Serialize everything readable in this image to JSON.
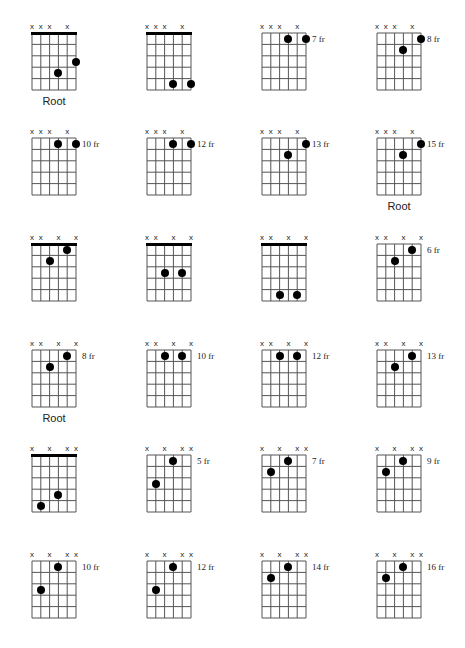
{
  "layout": {
    "columns_x": [
      32,
      147,
      262,
      377
    ],
    "rows_y": [
      33,
      138,
      244,
      350,
      455,
      561
    ],
    "grid_width": 44,
    "grid_height": 57,
    "strings": 6,
    "frets": 5
  },
  "colors": {
    "line": "#555555",
    "dot": "#000000",
    "text": "#222222",
    "background": "#ffffff"
  },
  "mute_symbol": "x",
  "diagrams": [
    {
      "muted": [
        0,
        1,
        2,
        4
      ],
      "nut": true,
      "fret_label": "",
      "root_label": "Root",
      "dots": [
        {
          "string": 3,
          "fret": 4
        },
        {
          "string": 5,
          "fret": 3
        }
      ]
    },
    {
      "muted": [
        0,
        1,
        2,
        4
      ],
      "nut": true,
      "fret_label": "",
      "root_label": "",
      "dots": [
        {
          "string": 3,
          "fret": 5
        },
        {
          "string": 5,
          "fret": 5
        }
      ]
    },
    {
      "muted": [
        0,
        1,
        2,
        4
      ],
      "nut": false,
      "fret_label": "7 fr",
      "root_label": "",
      "dots": [
        {
          "string": 3,
          "fret": 1
        },
        {
          "string": 5,
          "fret": 1
        }
      ]
    },
    {
      "muted": [
        0,
        1,
        2,
        4
      ],
      "nut": false,
      "fret_label": "8 fr",
      "root_label": "",
      "dots": [
        {
          "string": 5,
          "fret": 1
        },
        {
          "string": 3,
          "fret": 2
        }
      ]
    },
    {
      "muted": [
        0,
        1,
        2,
        4
      ],
      "nut": false,
      "fret_label": "10 fr",
      "root_label": "",
      "dots": [
        {
          "string": 3,
          "fret": 1
        },
        {
          "string": 5,
          "fret": 1
        }
      ]
    },
    {
      "muted": [
        0,
        1,
        2,
        4
      ],
      "nut": false,
      "fret_label": "12 fr",
      "root_label": "",
      "dots": [
        {
          "string": 3,
          "fret": 1
        },
        {
          "string": 5,
          "fret": 1
        }
      ]
    },
    {
      "muted": [
        0,
        1,
        2,
        4
      ],
      "nut": false,
      "fret_label": "13 fr",
      "root_label": "",
      "dots": [
        {
          "string": 5,
          "fret": 1
        },
        {
          "string": 3,
          "fret": 2
        }
      ]
    },
    {
      "muted": [
        0,
        1,
        2,
        4
      ],
      "nut": false,
      "fret_label": "15 fr",
      "root_label": "Root",
      "dots": [
        {
          "string": 5,
          "fret": 1
        },
        {
          "string": 3,
          "fret": 2
        }
      ]
    },
    {
      "muted": [
        0,
        1,
        3,
        5
      ],
      "nut": true,
      "fret_label": "",
      "root_label": "",
      "dots": [
        {
          "string": 4,
          "fret": 1
        },
        {
          "string": 2,
          "fret": 2
        }
      ]
    },
    {
      "muted": [
        0,
        1,
        3,
        5
      ],
      "nut": true,
      "fret_label": "",
      "root_label": "",
      "dots": [
        {
          "string": 2,
          "fret": 3
        },
        {
          "string": 4,
          "fret": 3
        }
      ]
    },
    {
      "muted": [
        0,
        1,
        3,
        5
      ],
      "nut": true,
      "fret_label": "",
      "root_label": "",
      "dots": [
        {
          "string": 2,
          "fret": 5
        },
        {
          "string": 4,
          "fret": 5
        }
      ]
    },
    {
      "muted": [
        0,
        1,
        3,
        5
      ],
      "nut": false,
      "fret_label": "6 fr",
      "root_label": "",
      "dots": [
        {
          "string": 4,
          "fret": 1
        },
        {
          "string": 2,
          "fret": 2
        }
      ]
    },
    {
      "muted": [
        0,
        1,
        3,
        5
      ],
      "nut": false,
      "fret_label": "8 fr",
      "root_label": "Root",
      "dots": [
        {
          "string": 4,
          "fret": 1
        },
        {
          "string": 2,
          "fret": 2
        }
      ]
    },
    {
      "muted": [
        0,
        1,
        3,
        5
      ],
      "nut": false,
      "fret_label": "10 fr",
      "root_label": "",
      "dots": [
        {
          "string": 2,
          "fret": 1
        },
        {
          "string": 4,
          "fret": 1
        }
      ]
    },
    {
      "muted": [
        0,
        1,
        3,
        5
      ],
      "nut": false,
      "fret_label": "12 fr",
      "root_label": "",
      "dots": [
        {
          "string": 2,
          "fret": 1
        },
        {
          "string": 4,
          "fret": 1
        }
      ]
    },
    {
      "muted": [
        0,
        1,
        3,
        5
      ],
      "nut": false,
      "fret_label": "13 fr",
      "root_label": "",
      "dots": [
        {
          "string": 4,
          "fret": 1
        },
        {
          "string": 2,
          "fret": 2
        }
      ]
    },
    {
      "muted": [
        0,
        2,
        4,
        5
      ],
      "nut": true,
      "fret_label": "",
      "root_label": "",
      "dots": [
        {
          "string": 3,
          "fret": 4
        },
        {
          "string": 1,
          "fret": 5
        }
      ]
    },
    {
      "muted": [
        0,
        2,
        4,
        5
      ],
      "nut": false,
      "fret_label": "5 fr",
      "root_label": "",
      "dots": [
        {
          "string": 3,
          "fret": 1
        },
        {
          "string": 1,
          "fret": 3
        }
      ]
    },
    {
      "muted": [
        0,
        2,
        4,
        5
      ],
      "nut": false,
      "fret_label": "7 fr",
      "root_label": "",
      "dots": [
        {
          "string": 3,
          "fret": 1
        },
        {
          "string": 1,
          "fret": 2
        }
      ]
    },
    {
      "muted": [
        0,
        2,
        4,
        5
      ],
      "nut": false,
      "fret_label": "9 fr",
      "root_label": "",
      "dots": [
        {
          "string": 3,
          "fret": 1
        },
        {
          "string": 1,
          "fret": 2
        }
      ]
    },
    {
      "muted": [
        0,
        2,
        4,
        5
      ],
      "nut": false,
      "fret_label": "10 fr",
      "root_label": "",
      "dots": [
        {
          "string": 3,
          "fret": 1
        },
        {
          "string": 1,
          "fret": 3
        }
      ]
    },
    {
      "muted": [
        0,
        2,
        4,
        5
      ],
      "nut": false,
      "fret_label": "12 fr",
      "root_label": "",
      "dots": [
        {
          "string": 3,
          "fret": 1
        },
        {
          "string": 1,
          "fret": 3
        }
      ]
    },
    {
      "muted": [
        0,
        2,
        4,
        5
      ],
      "nut": false,
      "fret_label": "14 fr",
      "root_label": "",
      "dots": [
        {
          "string": 3,
          "fret": 1
        },
        {
          "string": 1,
          "fret": 2
        }
      ]
    },
    {
      "muted": [
        0,
        2,
        4,
        5
      ],
      "nut": false,
      "fret_label": "16 fr",
      "root_label": "",
      "dots": [
        {
          "string": 3,
          "fret": 1
        },
        {
          "string": 1,
          "fret": 2
        }
      ]
    }
  ]
}
